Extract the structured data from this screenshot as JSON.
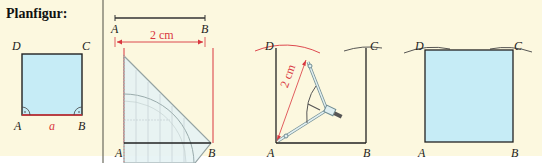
{
  "title": "Planfigur:",
  "colors": {
    "background": "#fcf8df",
    "square_fill": "#c6ecf6",
    "measure_red": "#d9363e",
    "line": "#222222"
  },
  "planfigur": {
    "vertices": {
      "A": "A",
      "B": "B",
      "C": "C",
      "D": "D"
    },
    "side_label": "a"
  },
  "step1": {
    "segment": {
      "start": "A",
      "end": "B"
    },
    "measure": "2 cm",
    "bottom": {
      "A": "A",
      "B": "B"
    }
  },
  "step2": {
    "vertices": {
      "A": "A",
      "B": "B",
      "C": "C",
      "D": "D"
    },
    "radius": "2 cm"
  },
  "step3": {
    "vertices": {
      "A": "A",
      "B": "B",
      "C": "C",
      "D": "D"
    }
  }
}
